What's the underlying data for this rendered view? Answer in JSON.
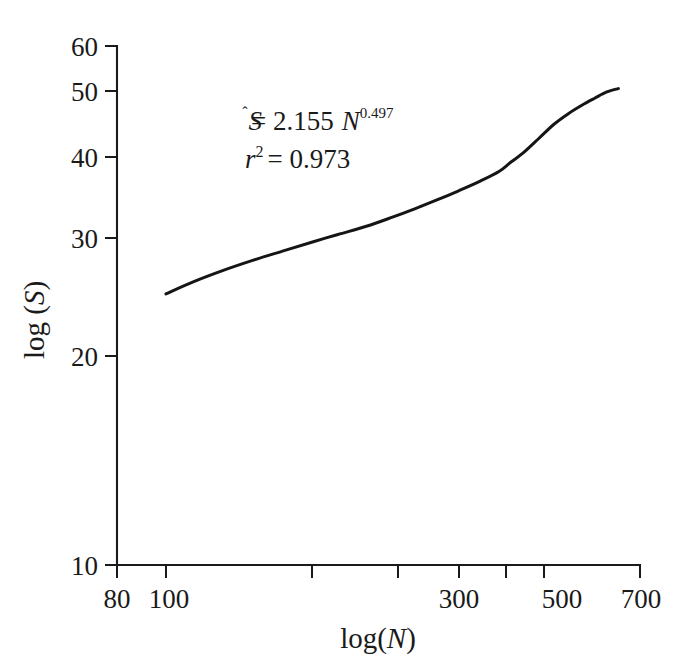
{
  "chart_data": {
    "type": "line",
    "title": "",
    "xlabel": "log(N)",
    "ylabel": "log (S)",
    "xscale": "log",
    "yscale": "log",
    "xlim": [
      80,
      700
    ],
    "ylim": [
      10,
      60
    ],
    "grid": false,
    "legend": null,
    "x_ticks": [
      {
        "value": 80,
        "label": "80"
      },
      {
        "value": 100,
        "label": "100"
      },
      {
        "value": 200,
        "label": ""
      },
      {
        "value": 300,
        "label": "300"
      },
      {
        "value": 400,
        "label": ""
      },
      {
        "value": 500,
        "label": "500"
      },
      {
        "value": 600,
        "label": ""
      },
      {
        "value": 700,
        "label": "700"
      }
    ],
    "y_ticks": [
      {
        "value": 10,
        "label": "10"
      },
      {
        "value": 20,
        "label": "20"
      },
      {
        "value": 30,
        "label": "30"
      },
      {
        "value": 40,
        "label": "40"
      },
      {
        "value": 50,
        "label": "50"
      },
      {
        "value": 60,
        "label": "60"
      }
    ],
    "series": [
      {
        "name": "species-accumulation",
        "color": "#151515",
        "x": [
          98,
          110,
          125,
          140,
          160,
          180,
          200,
          225,
          250,
          275,
          300,
          330,
          360,
          390,
          410,
          430,
          460,
          490,
          520,
          550,
          580,
          610,
          640
        ],
        "y": [
          25.5,
          26.6,
          27.7,
          28.6,
          29.6,
          30.5,
          31.3,
          32.2,
          33.2,
          34.2,
          35.2,
          36.4,
          37.6,
          38.9,
          40.2,
          41.4,
          43.6,
          45.8,
          47.5,
          48.9,
          50.1,
          51.2,
          51.8
        ]
      }
    ],
    "annotations": [
      {
        "name": "fit-equation",
        "parts": {
          "s_hat": "S",
          "hat": "̂",
          "equals": "= 2.155",
          "var_n": "N",
          "exponent": "0.497"
        },
        "plain": "Ŝ = 2.155 N^0.497"
      },
      {
        "name": "r-squared",
        "parts": {
          "var_r": "r",
          "sup": "2",
          "equals_value": "= 0.973"
        },
        "plain": "r² = 0.973"
      }
    ]
  },
  "labels": {
    "y_axis_title": "log (S)",
    "y_axis_title_prefix": "log (",
    "y_axis_title_var": "S",
    "y_axis_title_suffix": ")",
    "x_axis_title_prefix": "log(",
    "x_axis_title_var": "N",
    "x_axis_title_suffix": ")"
  }
}
